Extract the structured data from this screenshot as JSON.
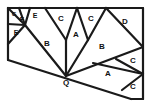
{
  "figure": {
    "name": "triangle-dissection-diagram",
    "background_color": "#ffffff",
    "line_color": "#1a1a1a",
    "label_color": "#111111",
    "width": 151,
    "height": 107
  },
  "outline": {
    "name": "outer-boundary",
    "points": "8,8 143,8 143,99 131,99 66,76 8,60"
  },
  "vertices": {
    "Q": {
      "label": "Q",
      "x": 66,
      "y": 76
    }
  },
  "labels": [
    {
      "id": "g1",
      "text": "G",
      "x": 14,
      "y": 14,
      "size": 6
    },
    {
      "id": "f1",
      "text": "F",
      "x": 22,
      "y": 20,
      "size": 7
    },
    {
      "id": "e1",
      "text": "E",
      "x": 35,
      "y": 16,
      "size": 7
    },
    {
      "id": "e2",
      "text": "E",
      "x": 16,
      "y": 33,
      "size": 7
    },
    {
      "id": "c1",
      "text": "C",
      "x": 61,
      "y": 19,
      "size": 8
    },
    {
      "id": "c2",
      "text": "C",
      "x": 91,
      "y": 19,
      "size": 8
    },
    {
      "id": "d1",
      "text": "D",
      "x": 125,
      "y": 22,
      "size": 8
    },
    {
      "id": "a1",
      "text": "A",
      "x": 76,
      "y": 35,
      "size": 8
    },
    {
      "id": "b1",
      "text": "B",
      "x": 47,
      "y": 44,
      "size": 8
    },
    {
      "id": "b2",
      "text": "B",
      "x": 102,
      "y": 47,
      "size": 8
    },
    {
      "id": "c3",
      "text": "C",
      "x": 133,
      "y": 61,
      "size": 8
    },
    {
      "id": "a2",
      "text": "A",
      "x": 108,
      "y": 74,
      "size": 8
    },
    {
      "id": "c4",
      "text": "C",
      "x": 133,
      "y": 87,
      "size": 8
    },
    {
      "id": "q1",
      "text": "Q",
      "x": 66,
      "y": 83,
      "size": 8
    }
  ],
  "segments": [
    {
      "id": "top-edge",
      "d": "M8,8 L143,8"
    },
    {
      "id": "right-edge",
      "d": "M143,8 L143,99"
    },
    {
      "id": "left-edge",
      "d": "M8,8 L8,60"
    },
    {
      "id": "bottom-long",
      "d": "M8,60 L131,99"
    },
    {
      "id": "bottom-right",
      "d": "M131,99 L143,99"
    },
    {
      "id": "g-f-split",
      "d": "M8,8 L25,25"
    },
    {
      "id": "f-e-split",
      "d": "M19,8 L25,25"
    },
    {
      "id": "e-upper",
      "d": "M30,8 L25,25"
    },
    {
      "id": "e-left-lower",
      "d": "M8,24 L25,25"
    },
    {
      "id": "e-lower-fan",
      "d": "M8,44 L25,25"
    },
    {
      "id": "b1-left",
      "d": "M25,25 L66,76"
    },
    {
      "id": "c1-left",
      "d": "M45,8 L66,40"
    },
    {
      "id": "c1-right",
      "d": "M77,8 L66,40"
    },
    {
      "id": "a1-left",
      "d": "M66,40 L66,76"
    },
    {
      "id": "c2-left",
      "d": "M77,8 L88,40"
    },
    {
      "id": "c2-right",
      "d": "M106,8 L88,40"
    },
    {
      "id": "a1-right",
      "d": "M88,40 L66,76"
    },
    {
      "id": "d-lower",
      "d": "M106,8 L143,47"
    },
    {
      "id": "b2-lower",
      "d": "M66,76 L143,47"
    },
    {
      "id": "a2-upper",
      "d": "M93,63 L143,74"
    },
    {
      "id": "c3-left",
      "d": "M116,59 L143,74"
    },
    {
      "id": "c4-left",
      "d": "M122,90 L143,74"
    }
  ]
}
